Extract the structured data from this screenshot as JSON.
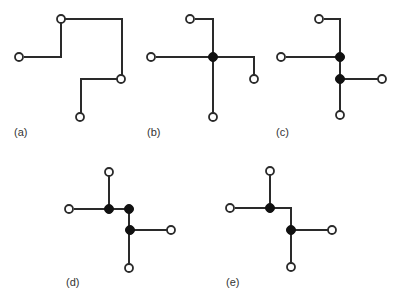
{
  "colors": {
    "line": "#2a2a2a",
    "terminal_fill": "#ffffff",
    "steiner_fill": "#111111",
    "label": "#333333"
  },
  "panels": [
    {
      "label": "(a)",
      "label_pos": [
        14,
        136
      ],
      "wires": [
        "M24,57 H61 V23",
        "M65,19 H122 V75",
        "M117,79 H81 V113"
      ],
      "terminals": [
        [
          19,
          57
        ],
        [
          61,
          19
        ],
        [
          121,
          79
        ],
        [
          80,
          117
        ]
      ],
      "steiner": []
    },
    {
      "label": "(b)",
      "label_pos": [
        147,
        136
      ],
      "wires": [
        "M195,19 H213 V113",
        "M156,57 H254 V75"
      ],
      "terminals": [
        [
          190,
          19
        ],
        [
          151,
          57
        ],
        [
          254,
          79
        ],
        [
          213,
          117
        ]
      ],
      "steiner": [
        [
          213,
          57
        ]
      ]
    },
    {
      "label": "(c)",
      "label_pos": [
        276,
        136
      ],
      "wires": [
        "M324,19 H340 V111",
        "M286,57 H340",
        "M340,79 H378"
      ],
      "terminals": [
        [
          319,
          19
        ],
        [
          281,
          57
        ],
        [
          382,
          79
        ],
        [
          340,
          115
        ]
      ],
      "steiner": [
        [
          340,
          57
        ],
        [
          340,
          79
        ]
      ]
    },
    {
      "label": "(d)",
      "label_pos": [
        66,
        286
      ],
      "wires": [
        "M109,176 V209",
        "M74,209 H129 V230 V264",
        "M130,230 H167"
      ],
      "terminals": [
        [
          109,
          172
        ],
        [
          69,
          209
        ],
        [
          171,
          230
        ],
        [
          129,
          268
        ]
      ],
      "steiner": [
        [
          109,
          209
        ],
        [
          129,
          209
        ],
        [
          130,
          230
        ]
      ]
    },
    {
      "label": "(e)",
      "label_pos": [
        226,
        286
      ],
      "wires": [
        "M270,175 V208",
        "M235,208 H291 V263",
        "M291,230 H328"
      ],
      "terminals": [
        [
          270,
          171
        ],
        [
          230,
          208
        ],
        [
          332,
          230
        ],
        [
          291,
          267
        ]
      ],
      "steiner": [
        [
          270,
          208
        ],
        [
          291,
          230
        ]
      ]
    }
  ]
}
